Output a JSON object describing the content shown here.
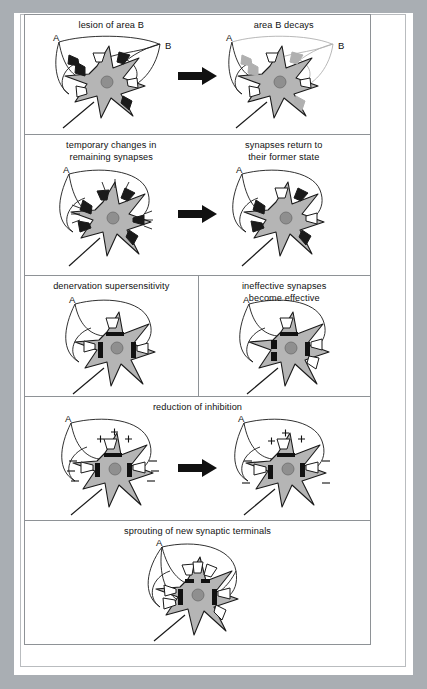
{
  "figure": {
    "title_present": false,
    "panel_count": 5,
    "colors": {
      "mount_gray": "#a9aeb3",
      "paper_white": "#ffffff",
      "frame_line": "#b9bcbf",
      "panel_line": "#8e9296",
      "soma_fill": "#b5b5b5",
      "nucleus_fill": "#8f8f8f",
      "terminal_active_fill": "#ffffff",
      "terminal_degenerating_fill": "#b0b0b0",
      "terminal_dark_fill": "#1a1a1a",
      "axon_line": "#1a1a1a",
      "arrow_fill": "#111111",
      "text": "#111111"
    },
    "rows": [
      {
        "id": "row-lesion",
        "layout": "pair-with-arrow",
        "left": {
          "caption": "lesion of area B",
          "labels": [
            "A",
            "B"
          ],
          "state": "intact",
          "terminal_states": [
            "dark",
            "white",
            "dark",
            "white",
            "dark",
            "white"
          ]
        },
        "right": {
          "caption": "area B decays",
          "labels": [
            "A",
            "B"
          ],
          "state": "b-degenerating",
          "terminal_states": [
            "gray",
            "white",
            "gray",
            "white",
            "gray",
            "white"
          ]
        },
        "arrow": "right-arrow"
      },
      {
        "id": "row-temporary-changes",
        "layout": "pair-with-arrow",
        "left": {
          "caption": "temporary changes in\nremaining synapses",
          "labels": [
            "A"
          ],
          "state": "hyperactive",
          "terminal_states": [
            "dark",
            "dark",
            "dark",
            "dark"
          ]
        },
        "right": {
          "caption": "synapses return to\ntheir former state",
          "labels": [
            "A"
          ],
          "state": "restored",
          "terminal_states": [
            "white",
            "white",
            "dark",
            "dark"
          ]
        },
        "arrow": "right-arrow"
      },
      {
        "id": "row-supersensitivity",
        "layout": "two-panels",
        "left": {
          "caption": "denervation supersensitivity",
          "labels": [
            "A"
          ],
          "state": "receptor-upregulated",
          "terminal_states": [
            "white",
            "white",
            "white"
          ]
        },
        "right": {
          "caption": "ineffective synapses\nbecome effective",
          "labels": [
            "A"
          ],
          "state": "unmasked",
          "terminal_states": [
            "white",
            "white",
            "white"
          ]
        },
        "arrow": null
      },
      {
        "id": "row-reduction-of-inhibition",
        "layout": "pair-with-arrow-shared-caption",
        "caption": "reduction of inhibition",
        "left": {
          "labels": [
            "A"
          ],
          "state": "inhibition-present",
          "signs": {
            "plus": 3,
            "minus": 4
          }
        },
        "right": {
          "labels": [
            "A"
          ],
          "state": "inhibition-reduced",
          "signs": {
            "plus": 3,
            "minus": 4
          }
        },
        "arrow": "right-arrow"
      },
      {
        "id": "row-sprouting",
        "layout": "single",
        "caption": "sprouting of new synaptic terminals",
        "center": {
          "labels": [
            "A"
          ],
          "state": "sprouted",
          "terminal_states": [
            "white",
            "white",
            "white",
            "white",
            "white",
            "white",
            "white"
          ]
        },
        "arrow": null
      }
    ]
  }
}
